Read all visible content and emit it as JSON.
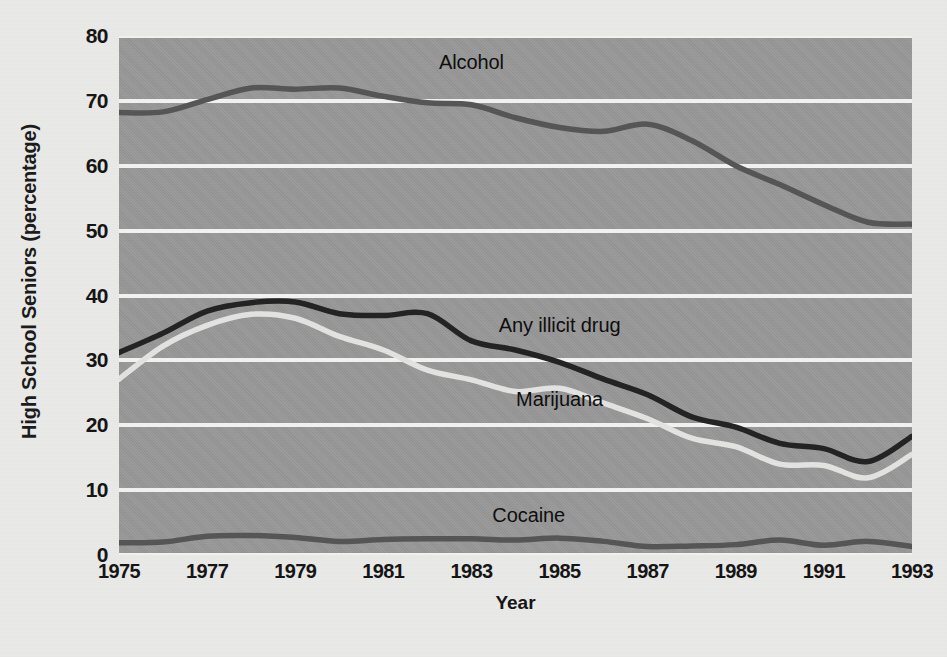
{
  "chart_data": {
    "type": "line",
    "title": "",
    "xlabel": "Year",
    "ylabel": "High School Seniors (percentage)",
    "xlim": [
      1975,
      1993
    ],
    "ylim": [
      0,
      80
    ],
    "grid": true,
    "legend_position": "inline-annotations",
    "x": [
      1975,
      1976,
      1977,
      1978,
      1979,
      1980,
      1981,
      1982,
      1983,
      1984,
      1985,
      1986,
      1987,
      1988,
      1989,
      1990,
      1991,
      1992,
      1993
    ],
    "x_tick_labels": [
      "1975",
      "1977",
      "1979",
      "1981",
      "1983",
      "1985",
      "1987",
      "1989",
      "1991",
      "1993"
    ],
    "x_tick_values": [
      1975,
      1977,
      1979,
      1981,
      1983,
      1985,
      1987,
      1989,
      1991,
      1993
    ],
    "y_tick_labels": [
      "0",
      "10",
      "20",
      "30",
      "40",
      "50",
      "60",
      "70",
      "80"
    ],
    "y_tick_values": [
      0,
      10,
      20,
      30,
      40,
      50,
      60,
      70,
      80
    ],
    "series": [
      {
        "name": "Alcohol",
        "color": "#555555",
        "label_x": 1983.0,
        "label_y": 76.0,
        "values": [
          68.2,
          68.3,
          70.2,
          72.0,
          71.8,
          72.0,
          70.7,
          69.7,
          69.4,
          67.4,
          65.9,
          65.3,
          66.4,
          63.9,
          60.0,
          57.1,
          54.0,
          51.3,
          51.0
        ]
      },
      {
        "name": "Any illicit drug",
        "color": "#222222",
        "label_x": 1985.0,
        "label_y": 35.5,
        "values": [
          31.2,
          34.2,
          37.6,
          38.9,
          39.0,
          37.2,
          36.9,
          37.2,
          33.0,
          31.6,
          29.7,
          27.1,
          24.7,
          21.3,
          19.7,
          17.2,
          16.4,
          14.4,
          18.3
        ]
      },
      {
        "name": "Marijuana",
        "color": "#e3e3e1",
        "label_x": 1985.0,
        "label_y": 24.0,
        "values": [
          27.1,
          32.2,
          35.4,
          37.1,
          36.5,
          33.7,
          31.6,
          28.5,
          27.0,
          25.2,
          25.7,
          23.4,
          21.0,
          18.0,
          16.7,
          14.0,
          13.8,
          11.9,
          15.5
        ]
      },
      {
        "name": "Cocaine",
        "color": "#555555",
        "label_x": 1984.3,
        "label_y": 6.2,
        "values": [
          1.9,
          2.0,
          2.9,
          3.0,
          2.7,
          2.1,
          2.4,
          2.5,
          2.5,
          2.3,
          2.6,
          2.1,
          1.3,
          1.4,
          1.6,
          2.3,
          1.5,
          2.1,
          1.3
        ]
      }
    ]
  }
}
